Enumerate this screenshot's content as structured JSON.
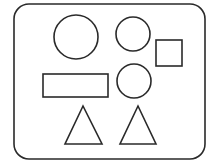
{
  "diagram": {
    "title": "",
    "stroke_color": "#2a2a2a",
    "background": "#ffffff",
    "frame": {
      "x": 14,
      "y": 4,
      "w": 191,
      "h": 155,
      "rx": 15
    },
    "shapes": [
      {
        "type": "circle",
        "label": "large-circle",
        "cx": 76,
        "cy": 37,
        "r": 22
      },
      {
        "type": "circle",
        "label": "small-circle-top",
        "cx": 133,
        "cy": 34,
        "r": 17
      },
      {
        "type": "square",
        "label": "square",
        "x": 156,
        "y": 40,
        "w": 26,
        "h": 26
      },
      {
        "type": "rect",
        "label": "rectangle",
        "x": 43,
        "y": 74,
        "w": 65,
        "h": 23
      },
      {
        "type": "circle",
        "label": "small-circle-middle",
        "cx": 134,
        "cy": 81,
        "r": 17
      },
      {
        "type": "triangle",
        "label": "triangle-left",
        "points": "83,106 65,144 102,144"
      },
      {
        "type": "triangle",
        "label": "triangle-right",
        "points": "138,106 120,144 156,144"
      }
    ]
  }
}
